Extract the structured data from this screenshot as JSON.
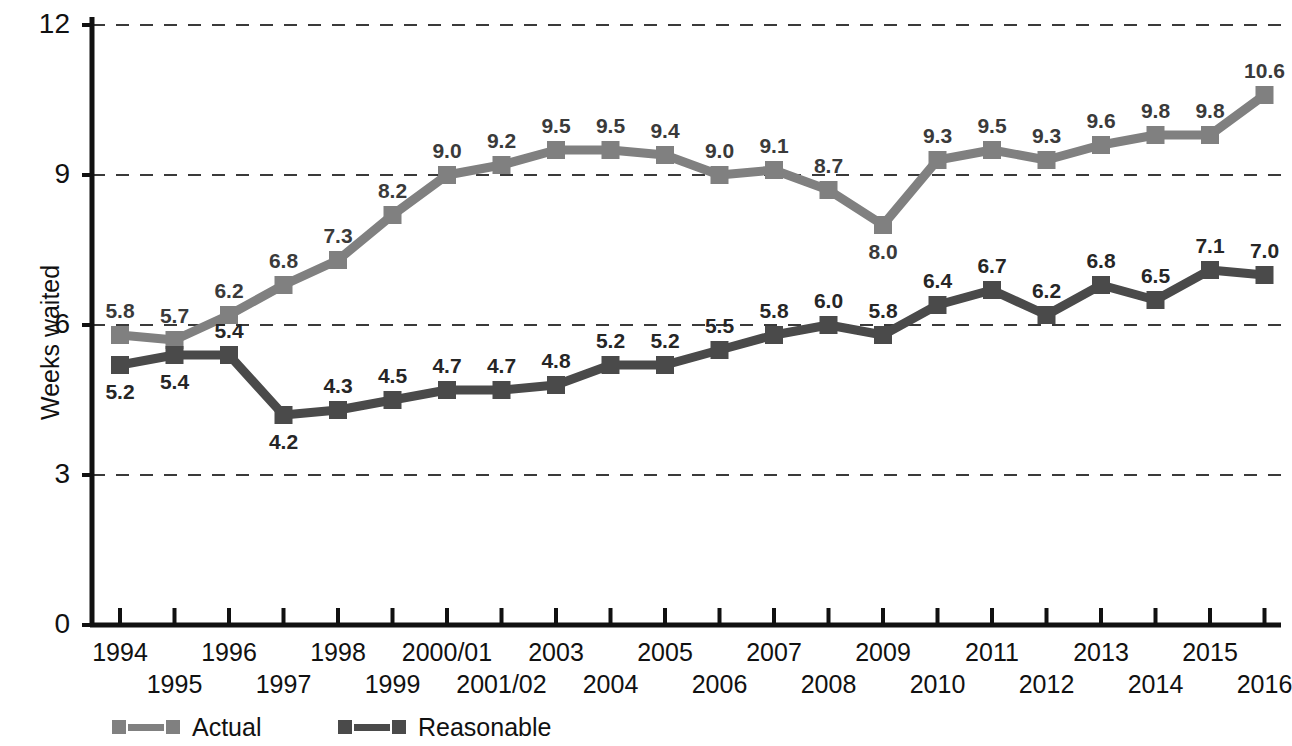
{
  "chart_data": {
    "type": "line",
    "title": "",
    "xlabel": "",
    "ylabel": "Weeks waited",
    "ylim": [
      0,
      12
    ],
    "yticks": [
      0,
      3,
      6,
      9,
      12
    ],
    "ytick_labels": [
      "0",
      "3",
      "6",
      "9",
      "12"
    ],
    "grid": "horizontal-dashed",
    "legend_position": "bottom-left",
    "categories": [
      "1994",
      "1995",
      "1996",
      "1997",
      "1998",
      "1999",
      "2000/01",
      "2001/02",
      "2003",
      "2004",
      "2005",
      "2006",
      "2007",
      "2008",
      "2009",
      "2010",
      "2011",
      "2012",
      "2013",
      "2014",
      "2015",
      "2016"
    ],
    "series": [
      {
        "name": "Actual",
        "color": "#808080",
        "values": [
          5.8,
          5.7,
          6.2,
          6.8,
          7.3,
          8.2,
          9.0,
          9.2,
          9.5,
          9.5,
          9.4,
          9.0,
          9.1,
          8.7,
          8.0,
          9.3,
          9.5,
          9.3,
          9.6,
          9.8,
          9.8,
          10.6
        ],
        "labels": [
          "5.8",
          "5.7",
          "6.2",
          "6.8",
          "7.3",
          "8.2",
          "9.0",
          "9.2",
          "9.5",
          "9.5",
          "9.4",
          "9.0",
          "9.1",
          "8.7",
          "8.0",
          "9.3",
          "9.5",
          "9.3",
          "9.6",
          "9.8",
          "9.8",
          "10.6"
        ],
        "label_positions": [
          "above",
          "above",
          "above",
          "above",
          "above",
          "above",
          "above",
          "above",
          "above",
          "above",
          "above",
          "above",
          "above",
          "above",
          "below",
          "above",
          "above",
          "above",
          "above",
          "above",
          "above",
          "above"
        ]
      },
      {
        "name": "Reasonable",
        "color": "#4a4a4a",
        "values": [
          5.2,
          5.4,
          5.4,
          4.2,
          4.3,
          4.5,
          4.7,
          4.7,
          4.8,
          5.2,
          5.2,
          5.5,
          5.8,
          6.0,
          5.8,
          6.4,
          6.7,
          6.2,
          6.8,
          6.5,
          7.1,
          7.0
        ],
        "labels": [
          "5.2",
          "5.4",
          "5.4",
          "4.2",
          "4.3",
          "4.5",
          "4.7",
          "4.7",
          "4.8",
          "5.2",
          "5.2",
          "5.5",
          "5.8",
          "6.0",
          "5.8",
          "6.4",
          "6.7",
          "6.2",
          "6.8",
          "6.5",
          "7.1",
          "7.0"
        ],
        "label_positions": [
          "below",
          "below",
          "above",
          "below",
          "above",
          "above",
          "above",
          "above",
          "above",
          "above",
          "above",
          "above",
          "above",
          "above",
          "above",
          "above",
          "above",
          "above",
          "above",
          "above",
          "above",
          "above"
        ]
      }
    ]
  },
  "legend": {
    "entries": [
      {
        "label": "Actual",
        "color": "#808080"
      },
      {
        "label": "Reasonable",
        "color": "#4a4a4a"
      }
    ]
  },
  "axes": {
    "y_title": "Weeks waited"
  }
}
